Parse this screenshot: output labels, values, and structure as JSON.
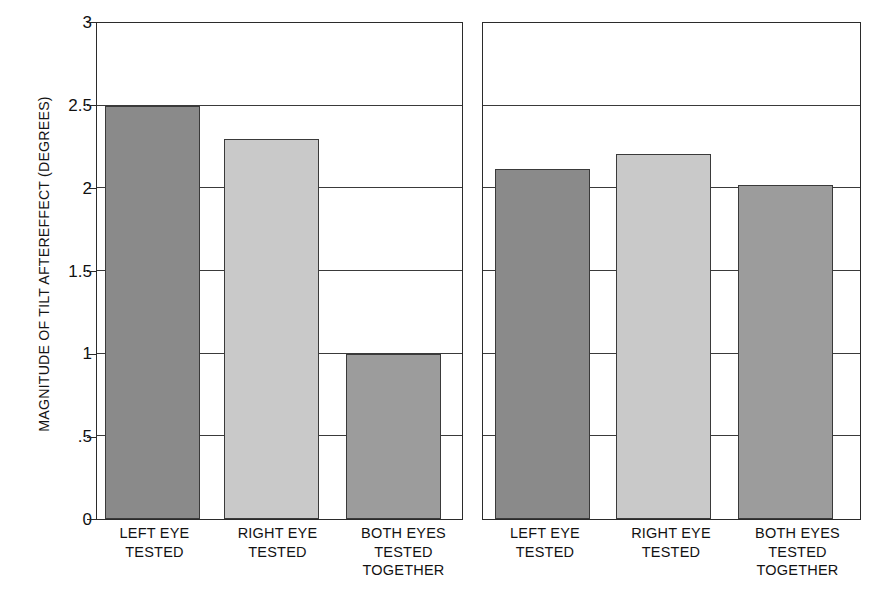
{
  "figure": {
    "y_axis_title": "MAGNITUDE OF TILT AFTEREFFECT (DEGREES)"
  },
  "chart_data": {
    "type": "bar",
    "title": "",
    "xlabel": "",
    "ylabel": "MAGNITUDE OF TILT AFTEREFFECT (DEGREES)",
    "ylim": [
      0,
      3
    ],
    "yticks": [
      0,
      0.5,
      1,
      1.5,
      2,
      2.5,
      3
    ],
    "ytick_labels": [
      "0",
      ".5",
      "1",
      "1.5",
      "2",
      "2.5",
      "3"
    ],
    "grid": true,
    "legend": "none",
    "panels": [
      {
        "name": "left-panel",
        "categories": [
          "LEFT EYE\nTESTED",
          "RIGHT EYE\nTESTED",
          "BOTH EYES\nTESTED\nTOGETHER"
        ],
        "values": [
          2.5,
          2.3,
          1.0
        ],
        "colors": [
          "#8a8a8a",
          "#c9c9c9",
          "#9c9c9c"
        ]
      },
      {
        "name": "right-panel",
        "categories": [
          "LEFT EYE\nTESTED",
          "RIGHT EYE\nTESTED",
          "BOTH EYES\nTESTED\nTOGETHER"
        ],
        "values": [
          2.12,
          2.21,
          2.02
        ],
        "colors": [
          "#8a8a8a",
          "#c9c9c9",
          "#9c9c9c"
        ]
      }
    ]
  },
  "ticks": {
    "t0": "0",
    "t1": ".5",
    "t2": "1",
    "t3": "1.5",
    "t4": "2",
    "t5": "2.5",
    "t6": "3"
  },
  "left_panel_labels": {
    "c0": "LEFT EYE\nTESTED",
    "c1": "RIGHT EYE\nTESTED",
    "c2": "BOTH EYES\nTESTED\nTOGETHER"
  },
  "right_panel_labels": {
    "c0": "LEFT EYE\nTESTED",
    "c1": "RIGHT EYE\nTESTED",
    "c2": "BOTH EYES\nTESTED\nTOGETHER"
  }
}
